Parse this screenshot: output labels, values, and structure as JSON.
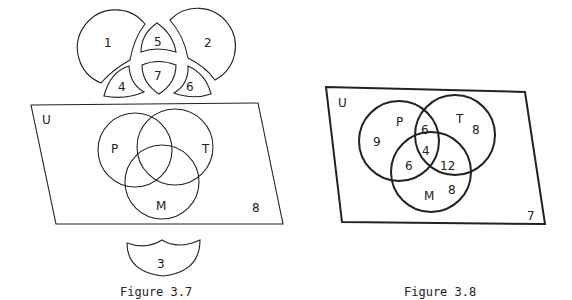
{
  "figures": [
    {
      "caption": "Figure 3.7",
      "universe_label": "U",
      "sets": [
        "P",
        "T",
        "M"
      ],
      "outside_region": "8",
      "exploded_regions": [
        "1",
        "2",
        "5",
        "7",
        "4",
        "6"
      ],
      "detached_region": "3"
    },
    {
      "caption": "Figure 3.8",
      "universe_label": "U",
      "sets": [
        "P",
        "T",
        "M"
      ],
      "region_counts": {
        "P_only": "9",
        "T_only": "8",
        "M_only": "8",
        "P_and_T_only": "6",
        "P_and_M_only": "6",
        "T_and_M_only": "12",
        "P_T_M": "4",
        "outside": "7"
      }
    }
  ],
  "colors": {
    "stroke": "#222222",
    "background": "#ffffff"
  }
}
